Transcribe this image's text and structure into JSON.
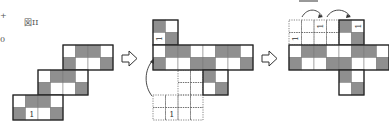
{
  "figure_label": "図II",
  "margin_marks": [
    "+",
    "0"
  ],
  "colors": {
    "shaded": "#8f8f8f",
    "empty": "#ffffff",
    "line": "#222222",
    "dotted": "#666666"
  },
  "cell_size": 12.5,
  "figures": [
    {
      "id": "original-net",
      "blocks": [
        {
          "x": 63,
          "y": 45,
          "rows": [
            [
              "W",
              "G",
              "G",
              "W"
            ],
            [
              "G",
              "W",
              "W",
              "G"
            ]
          ]
        },
        {
          "x": 38,
          "y": 70,
          "rows": [
            [
              "W",
              "G",
              "G",
              "W"
            ],
            [
              "G",
              "W",
              "W",
              "G"
            ]
          ]
        },
        {
          "x": 13,
          "y": 95,
          "rows": [
            [
              "W",
              "G",
              "G",
              "W"
            ],
            [
              "G",
              "1",
              "W",
              "G"
            ]
          ]
        }
      ]
    },
    {
      "id": "step-one",
      "blocks": [
        {
          "x": 153,
          "y": 20,
          "rows": [
            [
              "G",
              "W"
            ],
            [
              "1r",
              "G"
            ]
          ]
        },
        {
          "x": 153,
          "y": 45,
          "rows": [
            [
              "W",
              "G",
              "G",
              "W",
              "W",
              "G",
              "G",
              "W"
            ],
            [
              "G",
              "W",
              "W",
              "G",
              "G",
              "W",
              "W",
              "G"
            ]
          ]
        },
        {
          "x": 203,
          "y": 70,
          "rows": [
            [
              "G",
              "W"
            ],
            [
              "W",
              "G"
            ]
          ]
        }
      ],
      "dotted": [
        {
          "x": 178,
          "y": 70,
          "cols": 2,
          "rows": 2,
          "labels": []
        },
        {
          "x": 153,
          "y": 95,
          "cols": 4,
          "rows": 2,
          "labels": [
            {
              "col": 1,
              "row": 1,
              "text": "1"
            }
          ]
        }
      ]
    },
    {
      "id": "step-two",
      "blocks": [
        {
          "x": 339,
          "y": 20,
          "rows": [
            [
              "G",
              "1r"
            ],
            [
              "W",
              "G"
            ]
          ]
        },
        {
          "x": 289,
          "y": 45,
          "rows": [
            [
              "W",
              "G",
              "G",
              "W",
              "W",
              "G",
              "G",
              "W"
            ],
            [
              "G",
              "W",
              "W",
              "G",
              "G",
              "W",
              "W",
              "G"
            ]
          ]
        },
        {
          "x": 339,
          "y": 70,
          "rows": [
            [
              "G",
              "W"
            ],
            [
              "W",
              "G"
            ]
          ]
        }
      ],
      "dotted": [
        {
          "x": 289,
          "y": 20,
          "cols": 4,
          "rows": 2,
          "labels": [
            {
              "col": 0,
              "row": 1,
              "text": "1"
            },
            {
              "col": 2,
              "row": 0,
              "text": "1"
            }
          ]
        }
      ]
    }
  ],
  "arrows": [
    "hollow-right-arrow",
    "hollow-right-arrow"
  ]
}
